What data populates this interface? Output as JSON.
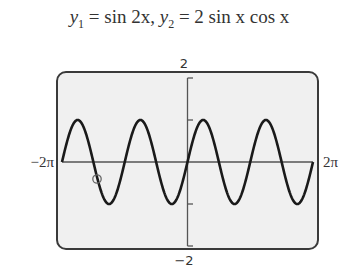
{
  "title": {
    "y1_label": "y",
    "y1_sub": "1",
    "y1_expr": " = sin 2x,  ",
    "y2_label": "y",
    "y2_sub": "2",
    "y2_expr": " = 2 sin x cos x"
  },
  "axes": {
    "ymax_label": "2",
    "ymin_label": "−2",
    "xmin_label": "−2π",
    "xmax_label": "2π"
  },
  "colors": {
    "screen_bg": "#f0f0f0",
    "frame": "#3a3a3a",
    "curve": "#1a1a1a",
    "axis": "#555555"
  },
  "chart_data": {
    "type": "line",
    "title": "y1 = sin 2x,  y2 = 2 sin x cos x",
    "xlabel": "",
    "ylabel": "",
    "xlim": [
      -6.2832,
      6.2832
    ],
    "ylim": [
      -2,
      2
    ],
    "x_tick_labels": [
      "−2π",
      "2π"
    ],
    "y_tick_labels": [
      "2",
      "−2"
    ],
    "y_ticks": [
      -2,
      -1,
      1,
      2
    ],
    "grid": false,
    "legend": null,
    "series": [
      {
        "name": "y1 = sin 2x (identical to y2 = 2 sin x cos x)",
        "function": "sin(2x)",
        "x": [
          -6.2832,
          -5.4978,
          -4.7124,
          -3.927,
          -3.1416,
          -2.3562,
          -1.5708,
          -0.7854,
          0,
          0.7854,
          1.5708,
          2.3562,
          3.1416,
          3.927,
          4.7124,
          5.4978,
          6.2832
        ],
        "values": [
          0,
          1,
          0,
          -1,
          0,
          1,
          0,
          -1,
          0,
          1,
          0,
          -1,
          0,
          1,
          0,
          -1,
          0
        ]
      }
    ],
    "annotations": [
      {
        "type": "trace-cursor-circle",
        "x": -4.5,
        "y": -0.4
      }
    ]
  }
}
